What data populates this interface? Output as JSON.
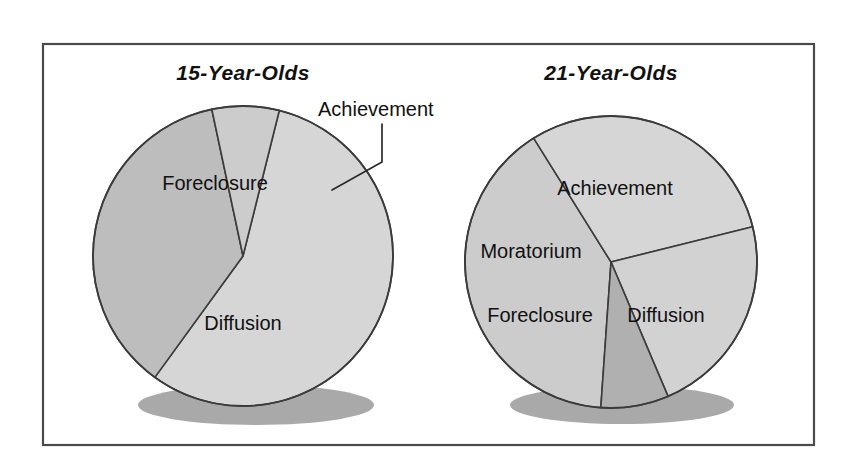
{
  "figure": {
    "background_color": "#ffffff",
    "frame": {
      "x": 43,
      "y": 44,
      "width": 771,
      "height": 401,
      "stroke_color": "#4a4a4a"
    }
  },
  "palette": {
    "diffusion": "#d6d6d6",
    "foreclosure": "#bdbdbd",
    "achievement": "#cccccc",
    "moratorium": "#b0b0b0",
    "outline": "#3b3b3b",
    "shadow": "#9a9a9a",
    "text": "#111111"
  },
  "annotations": {
    "achievement_callout": "Achievement"
  },
  "chart_data": [
    {
      "type": "pie",
      "id": "fifteen-year-olds",
      "title": "15-Year-Olds",
      "center": {
        "x": 243,
        "y": 256
      },
      "radius": 150,
      "legend": "none",
      "categories": [
        "Diffusion",
        "Foreclosure",
        "Achievement",
        "Moratorium"
      ],
      "values": [
        56,
        37,
        7,
        0
      ],
      "slices": [
        {
          "label": "Diffusion",
          "value": 56,
          "color": "#d6d6d6",
          "start_angle": 14,
          "end_angle": 216,
          "label_x": 243,
          "label_y": 330,
          "label_visible": true
        },
        {
          "label": "Foreclosure",
          "value": 37,
          "color": "#bdbdbd",
          "start_angle": 216,
          "end_angle": 348,
          "label_x": 215,
          "label_y": 190,
          "label_visible": true
        },
        {
          "label": "Achievement",
          "value": 7,
          "color": "#cccccc",
          "start_angle": 348,
          "end_angle": 374,
          "label_x": 0,
          "label_y": 0,
          "label_visible": false
        }
      ],
      "callout": {
        "label": "Achievement",
        "text_x": 318,
        "text_y": 116,
        "path": "M 382,124 L 382,162 L 332,190"
      }
    },
    {
      "type": "pie",
      "id": "twentyone-year-olds",
      "title": "21-Year-Olds",
      "center": {
        "x": 611,
        "y": 262
      },
      "radius": 146,
      "legend": "none",
      "categories": [
        "Achievement",
        "Diffusion",
        "Foreclosure",
        "Moratorium"
      ],
      "values": [
        40,
        30,
        22,
        8
      ],
      "slices": [
        {
          "label": "Achievement",
          "value": 40,
          "color": "#cccccc",
          "start_angle": 184,
          "end_angle": 328,
          "label_x": 615,
          "label_y": 195,
          "label_visible": true
        },
        {
          "label": "Diffusion",
          "value": 30,
          "color": "#d6d6d6",
          "start_angle": 328,
          "end_angle": 436,
          "label_x": 666,
          "label_y": 322,
          "label_visible": true
        },
        {
          "label": "Foreclosure",
          "value": 22,
          "color": "#d2d2d2",
          "start_angle": 76,
          "end_angle": 157,
          "label_x": 540,
          "label_y": 322,
          "label_visible": true
        },
        {
          "label": "Moratorium",
          "value": 8,
          "color": "#b0b0b0",
          "start_angle": 157,
          "end_angle": 184,
          "label_x": 531,
          "label_y": 258,
          "label_visible": true
        }
      ]
    }
  ]
}
